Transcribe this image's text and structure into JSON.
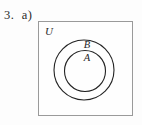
{
  "problem": {
    "label": "3.  a)"
  },
  "diagram": {
    "type": "venn",
    "universe_label": "U",
    "sets": [
      {
        "name": "B",
        "label": "B",
        "relation": "subset-of-universe"
      },
      {
        "name": "A",
        "label": "A",
        "relation": "subset-of-B"
      }
    ],
    "colors": {
      "box_border": "#9a9a9a",
      "circle_stroke": "#232323",
      "background": "#fefefe",
      "text": "#2b2b2b"
    },
    "geometry": {
      "box": {
        "x": 38,
        "y": 21,
        "width": 95,
        "height": 95
      },
      "outer_circle": {
        "cx": 83,
        "cy": 69,
        "r": 30
      },
      "inner_circle": {
        "cx": 84,
        "cy": 70,
        "r": 21
      }
    }
  }
}
